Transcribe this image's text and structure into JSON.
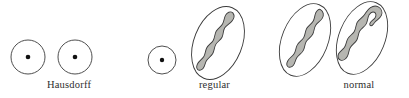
{
  "figure": {
    "background_color": "#ffffff",
    "stroke_color": "#3b3b3b",
    "blob_fill_color": "#b6b6b1",
    "point_color": "#111111"
  },
  "panels": [
    {
      "id": "hausdorff",
      "label": "Hausdorff",
      "description": "two points each enclosed in its own circular neighborhood",
      "objects": [
        {
          "kind": "point-in-circle",
          "cx": 28,
          "cy": 57,
          "r": 17,
          "dot_r": 2.3
        },
        {
          "kind": "point-in-circle",
          "cx": 75,
          "cy": 57,
          "r": 17,
          "dot_r": 2.3
        }
      ]
    },
    {
      "id": "regular",
      "label": "regular",
      "description": "a point and a closed set each enclosed in a neighborhood",
      "objects": [
        {
          "kind": "point-in-circle",
          "cx": 22,
          "cy": 60,
          "r": 14,
          "dot_r": 2.2
        },
        {
          "kind": "blob-in-ellipse",
          "cx": 78,
          "cy": 43,
          "rx": 24,
          "ry": 38,
          "rotate": 22
        }
      ]
    },
    {
      "id": "normal",
      "label": "normal",
      "description": "two disjoint closed sets each enclosed in a neighborhood",
      "objects": [
        {
          "kind": "blob-in-ellipse",
          "cx": 40,
          "cy": 40,
          "rx": 23,
          "ry": 38,
          "rotate": 22
        },
        {
          "kind": "blob-in-ellipse",
          "cx": 97,
          "cy": 38,
          "rx": 23,
          "ry": 38,
          "rotate": 22
        }
      ]
    }
  ]
}
